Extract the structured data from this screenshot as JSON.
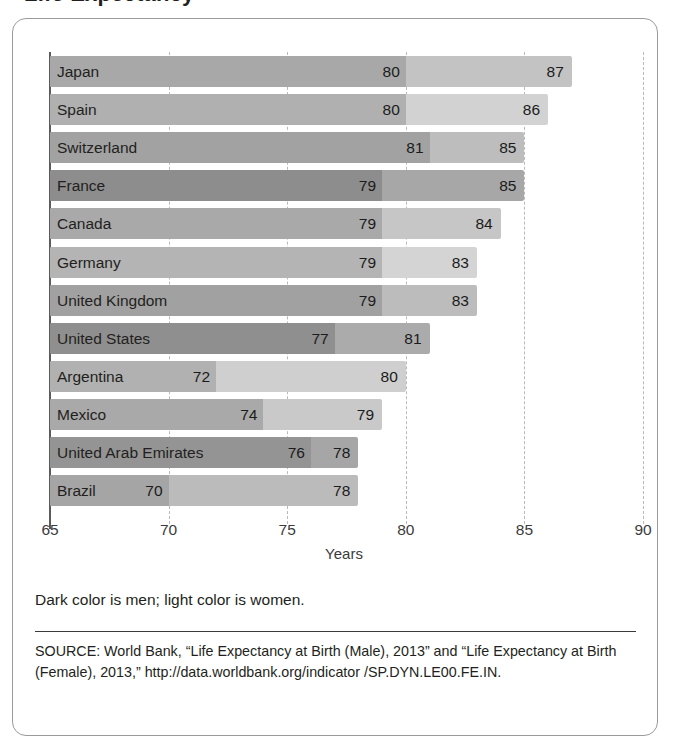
{
  "title_clipped": "Life Expectancy",
  "chart_data": {
    "type": "bar",
    "orientation": "horizontal",
    "title": "",
    "xlabel": "Years",
    "ylabel": "",
    "xlim": [
      65,
      90
    ],
    "xticks": [
      65,
      70,
      75,
      80,
      85,
      90
    ],
    "grid": "vertical dashed gridlines at 70, 75, 80, 85, 90",
    "legend": "Dark color is men; light color is women.",
    "categories": [
      "Japan",
      "Spain",
      "Switzerland",
      "France",
      "Canada",
      "Germany",
      "United Kingdom",
      "United States",
      "Argentina",
      "Mexico",
      "United Arab Emirates",
      "Brazil"
    ],
    "series": [
      {
        "name": "Men",
        "values": [
          80,
          80,
          81,
          79,
          79,
          79,
          79,
          77,
          72,
          74,
          76,
          70
        ]
      },
      {
        "name": "Women",
        "values": [
          87,
          86,
          85,
          85,
          84,
          83,
          83,
          81,
          80,
          79,
          78,
          78
        ]
      }
    ],
    "bar_colors": [
      {
        "country": "Japan",
        "male": "#a8a8a8",
        "female": "#c3c3c3"
      },
      {
        "country": "Spain",
        "male": "#b0b0b0",
        "female": "#d2d2d2"
      },
      {
        "country": "Switzerland",
        "male": "#a2a2a2",
        "female": "#bdbdbd"
      },
      {
        "country": "France",
        "male": "#8d8d8d",
        "female": "#a7a7a7"
      },
      {
        "country": "Canada",
        "male": "#a9a9a9",
        "female": "#c6c6c6"
      },
      {
        "country": "Germany",
        "male": "#b4b4b4",
        "female": "#d4d4d4"
      },
      {
        "country": "United Kingdom",
        "male": "#a1a1a1",
        "female": "#bcbcbc"
      },
      {
        "country": "United States",
        "male": "#8f8f8f",
        "female": "#ababab"
      },
      {
        "country": "Argentina",
        "male": "#b1b1b1",
        "female": "#cfcfcf"
      },
      {
        "country": "Mexico",
        "male": "#a9a9a9",
        "female": "#c9c9c9"
      },
      {
        "country": "United Arab Emirates",
        "male": "#949494",
        "female": "#a6a6a6"
      },
      {
        "country": "Brazil",
        "male": "#a5a5a5",
        "female": "#bbbbbb"
      }
    ]
  },
  "axis": {
    "ticks": [
      "65",
      "70",
      "75",
      "80",
      "85",
      "90"
    ],
    "title": "Years"
  },
  "notes": {
    "legend": "Dark color is men; light color is women.",
    "source": "SOURCE: World Bank, “Life Expectancy at Birth (Male), 2013” and “Life Expectancy at Birth (Female), 2013,” http://data.worldbank.org/indicator /SP.DYN.LE00.FE.IN."
  }
}
